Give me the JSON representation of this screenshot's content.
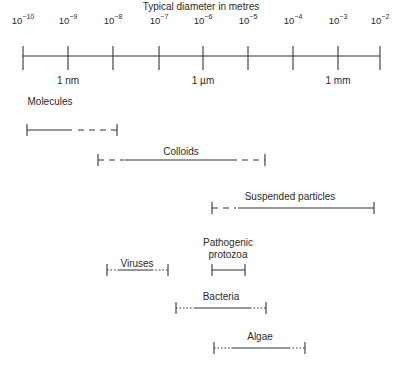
{
  "title": "Typical diameter in metres",
  "axis": {
    "ticks": [
      {
        "base": "10",
        "exp": "−10",
        "x": 23
      },
      {
        "base": "10",
        "exp": "−9",
        "x": 68
      },
      {
        "base": "10",
        "exp": "−8",
        "x": 113
      },
      {
        "base": "10",
        "exp": "−7",
        "x": 159
      },
      {
        "base": "10",
        "exp": "−6",
        "x": 203
      },
      {
        "base": "10",
        "exp": "−5",
        "x": 248
      },
      {
        "base": "10",
        "exp": "−4",
        "x": 293
      },
      {
        "base": "10",
        "exp": "−3",
        "x": 338
      },
      {
        "base": "10",
        "exp": "−2",
        "x": 380
      }
    ],
    "unit_labels": [
      {
        "text": "1 nm",
        "x": 68
      },
      {
        "text": "1 µm",
        "x": 203
      },
      {
        "text": "1 mm",
        "x": 338
      }
    ]
  },
  "ranges": [
    {
      "name": "Molecules",
      "label_x": 50,
      "label_y": 96,
      "y": 130,
      "start": 27,
      "end": 117,
      "segments": [
        {
          "from": 27,
          "to": 72,
          "style": "solid"
        },
        {
          "from": 78,
          "to": 117,
          "style": "dashed"
        }
      ]
    },
    {
      "name": "Colloids",
      "label_x": 181,
      "label_y": 146,
      "y": 160,
      "start": 98,
      "end": 265,
      "segments": [
        {
          "from": 98,
          "to": 124,
          "style": "dashed"
        },
        {
          "from": 125,
          "to": 237,
          "style": "solid"
        },
        {
          "from": 242,
          "to": 265,
          "style": "dashed"
        }
      ]
    },
    {
      "name": "Suspended particles",
      "label_x": 290,
      "label_y": 191,
      "y": 208,
      "start": 212,
      "end": 374,
      "segments": [
        {
          "from": 212,
          "to": 236,
          "style": "dashed"
        },
        {
          "from": 238,
          "to": 374,
          "style": "solid"
        }
      ]
    },
    {
      "name": "Viruses",
      "label_x": 137,
      "label_y": 258,
      "y": 270,
      "start": 107,
      "end": 168,
      "segments": [
        {
          "from": 107,
          "to": 118,
          "style": "dotted"
        },
        {
          "from": 118,
          "to": 152,
          "style": "solid"
        },
        {
          "from": 152,
          "to": 168,
          "style": "dotted"
        }
      ]
    },
    {
      "name": "Pathogenic protozoa",
      "label_lines": [
        "Pathogenic",
        "protozoa"
      ],
      "label_x": 228,
      "label_y": 237,
      "y": 270,
      "start": 212,
      "end": 245,
      "segments": [
        {
          "from": 212,
          "to": 245,
          "style": "solid"
        }
      ]
    },
    {
      "name": "Bacteria",
      "label_x": 221,
      "label_y": 291,
      "y": 308,
      "start": 176,
      "end": 266,
      "segments": [
        {
          "from": 176,
          "to": 194,
          "style": "dotted"
        },
        {
          "from": 194,
          "to": 250,
          "style": "solid"
        },
        {
          "from": 250,
          "to": 266,
          "style": "dotted"
        }
      ]
    },
    {
      "name": "Algae",
      "label_x": 260,
      "label_y": 331,
      "y": 348,
      "start": 214,
      "end": 305,
      "segments": [
        {
          "from": 214,
          "to": 232,
          "style": "dotted"
        },
        {
          "from": 232,
          "to": 289,
          "style": "solid"
        },
        {
          "from": 289,
          "to": 305,
          "style": "dotted"
        }
      ]
    }
  ]
}
